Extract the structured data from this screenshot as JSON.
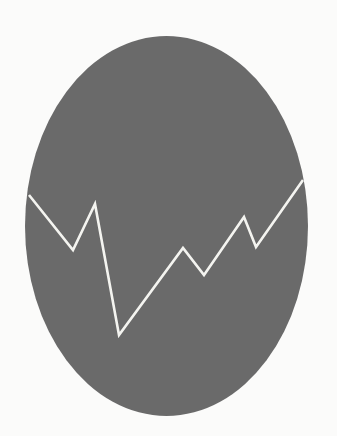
{
  "canvas": {
    "width": 337,
    "height": 436,
    "background": "#fbfbfa"
  },
  "icon": {
    "semantic": "trend-line-oval-icon",
    "ellipse": {
      "cx": 166.5,
      "cy": 226,
      "rx": 141.5,
      "ry": 190,
      "fill": "#6a6a6a"
    },
    "line": {
      "stroke": "#f4f4f0",
      "stroke_width": 2.6,
      "points": [
        [
          29,
          195
        ],
        [
          73,
          250
        ],
        [
          95,
          204
        ],
        [
          119,
          335
        ],
        [
          183,
          248
        ],
        [
          204,
          275
        ],
        [
          244,
          217
        ],
        [
          256,
          247
        ],
        [
          303,
          180
        ]
      ]
    }
  }
}
